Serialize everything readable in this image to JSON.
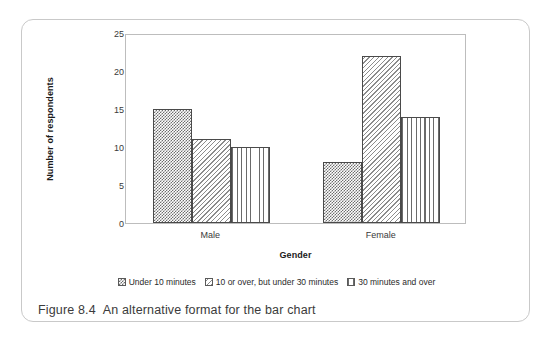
{
  "figure": {
    "caption_number": "Figure 8.4",
    "caption_text": "An alternative format for the bar chart"
  },
  "chart_data": {
    "type": "bar",
    "title": "",
    "xlabel": "Gender",
    "ylabel": "Number of respondents",
    "categories": [
      "Male",
      "Female"
    ],
    "series": [
      {
        "name": "Under 10 minutes",
        "pattern": "checker",
        "values": [
          15,
          8
        ]
      },
      {
        "name": "10 or over, but under 30 minutes",
        "pattern": "diagonal",
        "values": [
          11,
          22
        ]
      },
      {
        "name": "30 minutes and over",
        "pattern": "vertical",
        "values": [
          10,
          14
        ]
      }
    ],
    "ylim": [
      0,
      25
    ],
    "yticks": [
      0,
      5,
      10,
      15,
      20,
      25
    ],
    "ytick_labels": [
      "0",
      "5",
      "10",
      "15",
      "20",
      "25"
    ],
    "grid": false,
    "legend_position": "bottom",
    "colors": {
      "bar_outline": "#4a4a4a",
      "axis_line": "#bdbdbd",
      "text": "#3a3a3a",
      "card_border": "#c9c9c9"
    }
  },
  "axes": {
    "y_title": "Number of respondents",
    "x_title": "Gender"
  },
  "legend": {
    "items": [
      {
        "label": "Under 10 minutes",
        "swatch": "checker-swatch"
      },
      {
        "label": "10 or over, but under 30 minutes",
        "swatch": "diagonal-swatch"
      },
      {
        "label": "30 minutes and over",
        "swatch": "vertical-swatch"
      }
    ]
  }
}
